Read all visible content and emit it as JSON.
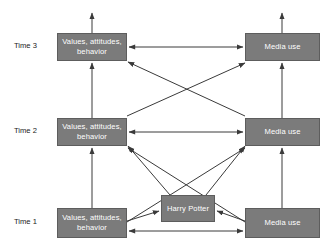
{
  "figure": {
    "type": "cross-lagged-panel-diagram",
    "background_color": "#ffffff",
    "box_fill_color": "#7b7b7b",
    "box_text_color": "#ffffff",
    "arrow_color": "#3a3a3a",
    "label_color": "#1a1a1a"
  },
  "time_labels": [
    {
      "id": "time3",
      "text": "Time 3",
      "x": 14,
      "y": 41
    },
    {
      "id": "time2",
      "text": "Time 2",
      "x": 14,
      "y": 126
    },
    {
      "id": "time1",
      "text": "Time 1",
      "x": 14,
      "y": 217
    }
  ],
  "nodes": [
    {
      "id": "t3-values",
      "label": "Values, attitudes, behavior",
      "x": 57,
      "y": 33,
      "w": 70,
      "h": 28
    },
    {
      "id": "t3-media",
      "label": "Media use",
      "x": 245,
      "y": 33,
      "w": 75,
      "h": 28
    },
    {
      "id": "t2-values",
      "label": "Values, attitudes, behavior",
      "x": 57,
      "y": 118,
      "w": 70,
      "h": 28
    },
    {
      "id": "t2-media",
      "label": "Media use",
      "x": 245,
      "y": 118,
      "w": 75,
      "h": 28
    },
    {
      "id": "t1-values",
      "label": "Values, attitudes, behavior",
      "x": 57,
      "y": 208,
      "w": 70,
      "h": 30
    },
    {
      "id": "harry-potter",
      "label": "Harry Potter",
      "x": 161,
      "y": 195,
      "w": 54,
      "h": 27
    },
    {
      "id": "t1-media",
      "label": "Media use",
      "x": 245,
      "y": 208,
      "w": 75,
      "h": 30
    }
  ],
  "edges": [
    {
      "id": "t3-values-out-up",
      "from": "t3-values",
      "to": "outcome",
      "kind": "vertical-out",
      "arrow": "end"
    },
    {
      "id": "t3-media-out-up",
      "from": "t3-media",
      "to": "outcome",
      "kind": "vertical-out",
      "arrow": "end"
    },
    {
      "id": "t3-correlation",
      "from": "t3-values",
      "to": "t3-media",
      "kind": "horizontal",
      "arrow": "both"
    },
    {
      "id": "t2-correlation",
      "from": "t2-values",
      "to": "t2-media",
      "kind": "horizontal",
      "arrow": "both"
    },
    {
      "id": "t1-correlation",
      "from": "t1-values",
      "to": "t1-media",
      "kind": "horizontal",
      "arrow": "both"
    },
    {
      "id": "t2-values-to-t3-values",
      "from": "t2-values",
      "to": "t3-values",
      "kind": "vertical",
      "arrow": "end"
    },
    {
      "id": "t2-media-to-t3-media",
      "from": "t2-media",
      "to": "t3-media",
      "kind": "vertical",
      "arrow": "end"
    },
    {
      "id": "t1-values-to-t2-values",
      "from": "t1-values",
      "to": "t2-values",
      "kind": "vertical",
      "arrow": "end"
    },
    {
      "id": "t1-media-to-t2-media",
      "from": "t1-media",
      "to": "t2-media",
      "kind": "vertical",
      "arrow": "end"
    },
    {
      "id": "t2-values-to-t3-media",
      "from": "t2-values",
      "to": "t3-media",
      "kind": "cross",
      "arrow": "end"
    },
    {
      "id": "t2-media-to-t3-values",
      "from": "t2-media",
      "to": "t3-values",
      "kind": "cross",
      "arrow": "end"
    },
    {
      "id": "t1-values-to-t2-media",
      "from": "t1-values",
      "to": "t2-media",
      "kind": "cross",
      "arrow": "end"
    },
    {
      "id": "t1-media-to-t2-values",
      "from": "t1-media",
      "to": "t2-values",
      "kind": "cross",
      "arrow": "end"
    },
    {
      "id": "harry-to-t2-values",
      "from": "harry-potter",
      "to": "t2-values",
      "kind": "cross",
      "arrow": "end"
    },
    {
      "id": "harry-to-t2-media",
      "from": "harry-potter",
      "to": "t2-media",
      "kind": "cross",
      "arrow": "end"
    },
    {
      "id": "t1-values-to-harry",
      "from": "t1-values",
      "to": "harry-potter",
      "kind": "horizontal",
      "arrow": "end"
    },
    {
      "id": "t1-media-to-harry",
      "from": "t1-media",
      "to": "harry-potter",
      "kind": "horizontal",
      "arrow": "end"
    }
  ]
}
